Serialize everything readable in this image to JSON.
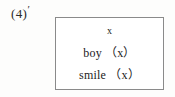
{
  "figure": {
    "label_number": "(4)",
    "label_prime": "′",
    "box": {
      "lines": [
        {
          "text": "x"
        },
        {
          "text": "boy （x）"
        },
        {
          "text": "smile （x）"
        }
      ]
    }
  },
  "colors": {
    "page_background": "#fdfdfc",
    "box_background": "#ffffff",
    "box_border": "#8a8a8a",
    "text": "#232323",
    "label_text": "#2b2b2b"
  }
}
